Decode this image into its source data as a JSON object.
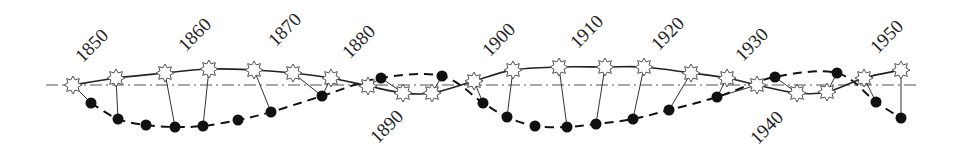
{
  "figure": {
    "axis": {
      "x1": 46,
      "x2": 920,
      "y": 85
    },
    "colors": {
      "line": "#222222",
      "dot": "#111111",
      "star_fill": "#ffffff",
      "star_stroke": "#555555",
      "axis": "#555555"
    },
    "year_labels": [
      {
        "text": "1850",
        "x": 93,
        "y": 47
      },
      {
        "text": "1860",
        "x": 196,
        "y": 36
      },
      {
        "text": "1870",
        "x": 286,
        "y": 31
      },
      {
        "text": "1880",
        "x": 360,
        "y": 43
      },
      {
        "text": "1890",
        "x": 388,
        "y": 128
      },
      {
        "text": "1900",
        "x": 500,
        "y": 41
      },
      {
        "text": "1910",
        "x": 588,
        "y": 33
      },
      {
        "text": "1920",
        "x": 669,
        "y": 35
      },
      {
        "text": "1930",
        "x": 753,
        "y": 46
      },
      {
        "text": "1940",
        "x": 768,
        "y": 129
      },
      {
        "text": "1950",
        "x": 888,
        "y": 38
      }
    ],
    "stars": [
      {
        "x": 73,
        "y": 85
      },
      {
        "x": 116,
        "y": 78
      },
      {
        "x": 165,
        "y": 73
      },
      {
        "x": 209,
        "y": 69
      },
      {
        "x": 254,
        "y": 70
      },
      {
        "x": 293,
        "y": 73
      },
      {
        "x": 331,
        "y": 78
      },
      {
        "x": 368,
        "y": 86
      },
      {
        "x": 403,
        "y": 93
      },
      {
        "x": 432,
        "y": 93
      },
      {
        "x": 474,
        "y": 81
      },
      {
        "x": 513,
        "y": 70
      },
      {
        "x": 559,
        "y": 67
      },
      {
        "x": 605,
        "y": 67
      },
      {
        "x": 644,
        "y": 67
      },
      {
        "x": 691,
        "y": 73
      },
      {
        "x": 727,
        "y": 78
      },
      {
        "x": 757,
        "y": 85
      },
      {
        "x": 797,
        "y": 93
      },
      {
        "x": 827,
        "y": 92
      },
      {
        "x": 864,
        "y": 78
      },
      {
        "x": 901,
        "y": 70
      }
    ],
    "dots": [
      {
        "x": 91,
        "y": 103
      },
      {
        "x": 118,
        "y": 119
      },
      {
        "x": 146,
        "y": 125
      },
      {
        "x": 175,
        "y": 127
      },
      {
        "x": 203,
        "y": 126
      },
      {
        "x": 238,
        "y": 120
      },
      {
        "x": 271,
        "y": 112
      },
      {
        "x": 322,
        "y": 96
      },
      {
        "x": 381,
        "y": 78
      },
      {
        "x": 442,
        "y": 76
      },
      {
        "x": 483,
        "y": 103
      },
      {
        "x": 507,
        "y": 117
      },
      {
        "x": 535,
        "y": 126
      },
      {
        "x": 567,
        "y": 127
      },
      {
        "x": 596,
        "y": 124
      },
      {
        "x": 633,
        "y": 119
      },
      {
        "x": 669,
        "y": 110
      },
      {
        "x": 717,
        "y": 97
      },
      {
        "x": 775,
        "y": 77
      },
      {
        "x": 837,
        "y": 73
      },
      {
        "x": 876,
        "y": 102
      },
      {
        "x": 901,
        "y": 118
      }
    ],
    "links": [
      [
        0,
        0
      ],
      [
        1,
        1
      ],
      [
        2,
        3
      ],
      [
        3,
        4
      ],
      [
        4,
        6
      ],
      [
        5,
        7
      ],
      [
        6,
        7
      ],
      [
        7,
        8
      ],
      [
        8,
        8
      ],
      [
        9,
        9
      ],
      [
        10,
        10
      ],
      [
        11,
        11
      ],
      [
        12,
        13
      ],
      [
        13,
        14
      ],
      [
        14,
        15
      ],
      [
        15,
        16
      ],
      [
        16,
        17
      ],
      [
        17,
        17
      ],
      [
        18,
        18
      ],
      [
        19,
        19
      ],
      [
        20,
        20
      ],
      [
        21,
        21
      ]
    ]
  }
}
